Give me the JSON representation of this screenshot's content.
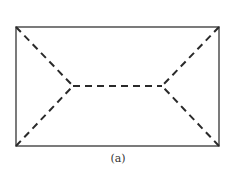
{
  "figure": {
    "caption": "(a)",
    "rect": {
      "x": 16,
      "y": 27,
      "width": 203,
      "height": 119
    },
    "inner_vertices": [
      {
        "name": "left",
        "x": 73,
        "y": 86
      },
      {
        "name": "right",
        "x": 162,
        "y": 86
      }
    ],
    "colors": {
      "outline": "#5a5a5a",
      "dash": "#2a2a2a",
      "background": "#ffffff"
    }
  }
}
